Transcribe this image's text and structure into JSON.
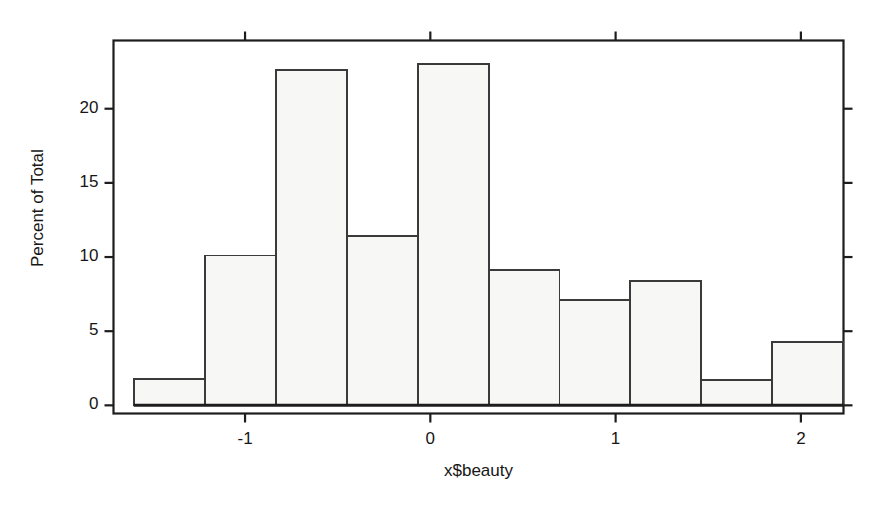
{
  "chart_data": {
    "type": "bar",
    "title": "",
    "subtitle": "",
    "xlabel": "x$beauty",
    "ylabel": "Percent of Total",
    "xlim": [
      -1.71,
      2.23
    ],
    "ylim": [
      -0.55,
      24.6
    ],
    "grid": false,
    "legend": null,
    "bin_width": 0.3825,
    "bin_edges": [
      -1.598,
      -1.215,
      -0.833,
      -0.45,
      -0.068,
      0.315,
      0.697,
      1.08,
      1.462,
      1.845,
      2.228
    ],
    "bin_centers": [
      -1.406,
      -1.024,
      -0.641,
      -0.259,
      0.124,
      0.506,
      0.889,
      1.271,
      1.654,
      2.036
    ],
    "categories": [
      "-1.41",
      "-1.02",
      "-0.64",
      "-0.26",
      "0.12",
      "0.51",
      "0.89",
      "1.27",
      "1.65",
      "2.04"
    ],
    "values": [
      1.8,
      10.1,
      22.6,
      11.4,
      23.0,
      9.1,
      7.1,
      8.4,
      1.7,
      4.3
    ],
    "xticks": [
      -1,
      0,
      1,
      2
    ],
    "xtick_labels": [
      "-1",
      "0",
      "1",
      "2"
    ],
    "yticks": [
      0,
      5,
      10,
      15,
      20
    ],
    "ytick_labels": [
      "0",
      "5",
      "10",
      "15",
      "20"
    ],
    "bar_fill": "#f7f7f5",
    "bar_stroke": "#3a3a3a",
    "axis_color": "#1d1d1d",
    "baseline_shown": true
  }
}
